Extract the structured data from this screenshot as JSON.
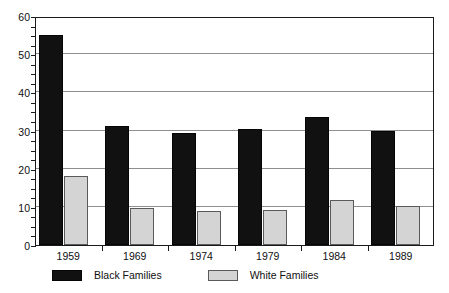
{
  "chart_data": {
    "type": "bar",
    "title": "",
    "subtitle": "",
    "xlabel": "",
    "ylabel": "",
    "categories": [
      "1959",
      "1969",
      "1974",
      "1979",
      "1984",
      "1989"
    ],
    "series": [
      {
        "name": "Black Families",
        "color": "#111111",
        "values": [
          55.0,
          31.3,
          29.3,
          30.4,
          33.5,
          30.0
        ]
      },
      {
        "name": "White Families",
        "color": "#d4d4d4",
        "values": [
          18.1,
          9.8,
          8.8,
          9.2,
          11.8,
          10.3
        ]
      }
    ],
    "ylim": [
      0,
      60
    ],
    "y_ticks": [
      0,
      10,
      20,
      30,
      40,
      50,
      60
    ],
    "y_tick_labels": [
      "0",
      "10",
      "20",
      "30",
      "40",
      "50",
      "60"
    ],
    "y_minor_tick_step": 2.5,
    "grid": true,
    "grid_axis": "y",
    "legend_position": "bottom",
    "frame": true
  },
  "legend": {
    "entries": [
      {
        "label": "Black Families",
        "swatch": "black-swatch"
      },
      {
        "label": "White Families",
        "swatch": "white-swatch"
      }
    ]
  }
}
